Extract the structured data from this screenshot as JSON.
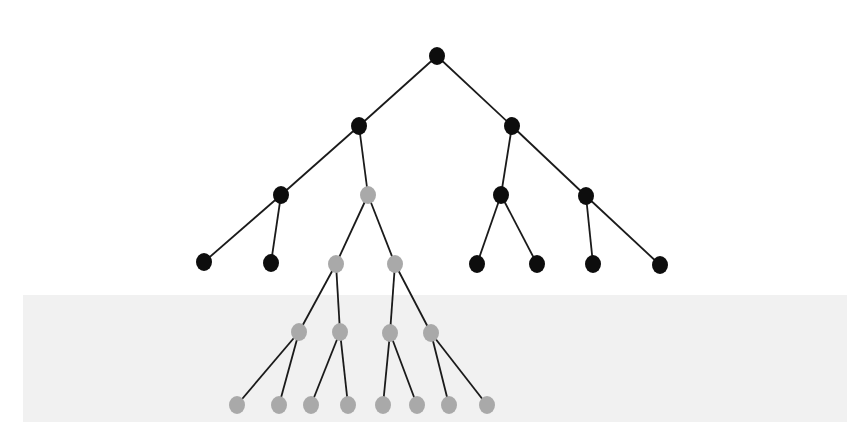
{
  "diagram": {
    "type": "tree",
    "colors": {
      "background": "#ffffff",
      "band": "#f1f1f1",
      "edge": "#1a1a1a",
      "node_black": "#0d0d0d",
      "node_gray": "#a9a9a9"
    },
    "band": {
      "x": 23,
      "y": 295,
      "width": 824,
      "height": 127
    },
    "node_size": {
      "rx": 8,
      "ry": 9
    },
    "nodes": [
      {
        "id": "n0",
        "x": 437,
        "y": 56,
        "color": "black",
        "level": 0
      },
      {
        "id": "n1",
        "x": 359,
        "y": 126,
        "color": "black",
        "level": 1
      },
      {
        "id": "n2",
        "x": 512,
        "y": 126,
        "color": "black",
        "level": 1
      },
      {
        "id": "n3",
        "x": 281,
        "y": 195,
        "color": "black",
        "level": 2
      },
      {
        "id": "n4",
        "x": 368,
        "y": 195,
        "color": "gray",
        "level": 2
      },
      {
        "id": "n5",
        "x": 501,
        "y": 195,
        "color": "black",
        "level": 2
      },
      {
        "id": "n6",
        "x": 586,
        "y": 196,
        "color": "black",
        "level": 2
      },
      {
        "id": "n7",
        "x": 204,
        "y": 262,
        "color": "black",
        "level": 3
      },
      {
        "id": "n8",
        "x": 271,
        "y": 263,
        "color": "black",
        "level": 3
      },
      {
        "id": "n9",
        "x": 336,
        "y": 264,
        "color": "gray",
        "level": 3
      },
      {
        "id": "n10",
        "x": 395,
        "y": 264,
        "color": "gray",
        "level": 3
      },
      {
        "id": "n11",
        "x": 477,
        "y": 264,
        "color": "black",
        "level": 3
      },
      {
        "id": "n12",
        "x": 537,
        "y": 264,
        "color": "black",
        "level": 3
      },
      {
        "id": "n13",
        "x": 593,
        "y": 264,
        "color": "black",
        "level": 3
      },
      {
        "id": "n14",
        "x": 660,
        "y": 265,
        "color": "black",
        "level": 3
      },
      {
        "id": "n15",
        "x": 299,
        "y": 332,
        "color": "gray",
        "level": 4
      },
      {
        "id": "n16",
        "x": 340,
        "y": 332,
        "color": "gray",
        "level": 4
      },
      {
        "id": "n17",
        "x": 390,
        "y": 333,
        "color": "gray",
        "level": 4
      },
      {
        "id": "n18",
        "x": 431,
        "y": 333,
        "color": "gray",
        "level": 4
      },
      {
        "id": "n19",
        "x": 237,
        "y": 405,
        "color": "gray",
        "level": 5
      },
      {
        "id": "n20",
        "x": 279,
        "y": 405,
        "color": "gray",
        "level": 5
      },
      {
        "id": "n21",
        "x": 311,
        "y": 405,
        "color": "gray",
        "level": 5
      },
      {
        "id": "n22",
        "x": 348,
        "y": 405,
        "color": "gray",
        "level": 5
      },
      {
        "id": "n23",
        "x": 383,
        "y": 405,
        "color": "gray",
        "level": 5
      },
      {
        "id": "n24",
        "x": 417,
        "y": 405,
        "color": "gray",
        "level": 5
      },
      {
        "id": "n25",
        "x": 449,
        "y": 405,
        "color": "gray",
        "level": 5
      },
      {
        "id": "n26",
        "x": 487,
        "y": 405,
        "color": "gray",
        "level": 5
      }
    ],
    "edges": [
      [
        "n0",
        "n1"
      ],
      [
        "n0",
        "n2"
      ],
      [
        "n1",
        "n3"
      ],
      [
        "n1",
        "n4"
      ],
      [
        "n2",
        "n5"
      ],
      [
        "n2",
        "n6"
      ],
      [
        "n3",
        "n7"
      ],
      [
        "n3",
        "n8"
      ],
      [
        "n4",
        "n9"
      ],
      [
        "n4",
        "n10"
      ],
      [
        "n5",
        "n11"
      ],
      [
        "n5",
        "n12"
      ],
      [
        "n6",
        "n13"
      ],
      [
        "n6",
        "n14"
      ],
      [
        "n9",
        "n15"
      ],
      [
        "n9",
        "n16"
      ],
      [
        "n10",
        "n17"
      ],
      [
        "n10",
        "n18"
      ],
      [
        "n15",
        "n19"
      ],
      [
        "n15",
        "n20"
      ],
      [
        "n16",
        "n21"
      ],
      [
        "n16",
        "n22"
      ],
      [
        "n17",
        "n23"
      ],
      [
        "n17",
        "n24"
      ],
      [
        "n18",
        "n25"
      ],
      [
        "n18",
        "n26"
      ]
    ]
  }
}
